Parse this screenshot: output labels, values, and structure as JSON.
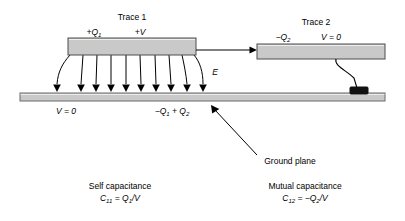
{
  "figure": {
    "title_trace1": "Trace 1",
    "title_trace2": "Trace 2",
    "trace1_charge_label": "+Q",
    "trace1_charge_sub": "1",
    "trace1_voltage_label": "+V",
    "trace2_charge_label": "−Q",
    "trace2_charge_sub": "2",
    "trace2_voltage_label": "V = 0",
    "ground_voltage_label": "V = 0",
    "ground_charge_label": "−Q",
    "ground_charge_sub1": "1",
    "ground_charge_mid": " + Q",
    "ground_charge_sub2": "2",
    "efield_label": "E",
    "ground_plane_label": "Ground plane",
    "self_cap_title": "Self capacitance",
    "self_cap_formula_lhs": "C",
    "self_cap_formula_lhs_sub": "11",
    "self_cap_formula_rhs": " = Q",
    "self_cap_formula_rhs_sub": "1",
    "self_cap_formula_tail": "/V",
    "mutual_cap_title": "Mutual capacitance",
    "mutual_cap_formula_lhs": "C",
    "mutual_cap_formula_lhs_sub": "12",
    "mutual_cap_formula_rhs": " = −Q",
    "mutual_cap_formula_rhs_sub": "2",
    "mutual_cap_formula_tail": "/V"
  },
  "colors": {
    "trace_fill": "#c9c9c9",
    "trace_stroke": "#4d4d4d",
    "ground_fill": "#c9c9c9",
    "ground_stroke": "#6b6b6b",
    "line": "#000000",
    "pad": "#111111",
    "background": "#ffffff"
  },
  "geometry": {
    "trace1": {
      "x": 68,
      "y": 38,
      "w": 128,
      "h": 17
    },
    "trace2": {
      "x": 257,
      "y": 44,
      "w": 128,
      "h": 15
    },
    "ground_plane": {
      "x": 20,
      "y": 93,
      "w": 365,
      "h": 8
    },
    "ground_pad": {
      "x": 350,
      "y": 87,
      "w": 18,
      "h": 7
    },
    "field_line_count": 10,
    "field_line_top": 55,
    "field_line_bottom": 92
  }
}
